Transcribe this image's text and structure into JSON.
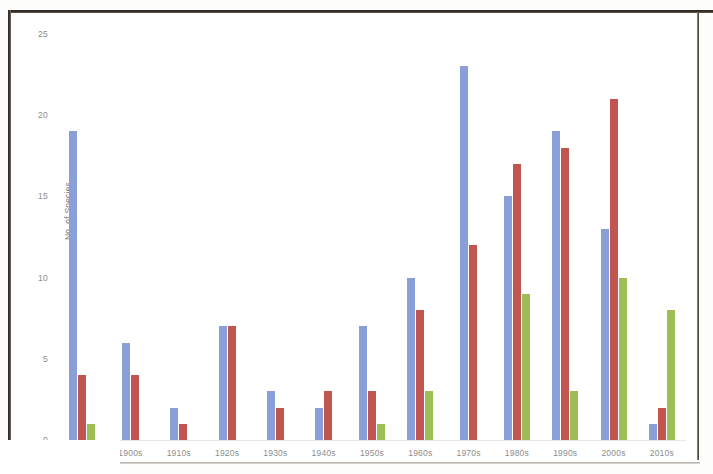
{
  "chart_data": {
    "type": "bar",
    "title": "",
    "xlabel": "",
    "ylabel": "No. of Species",
    "ylim": [
      0,
      25
    ],
    "yticks": [
      0,
      5,
      10,
      15,
      20,
      25
    ],
    "grid": false,
    "legend": "none",
    "categories": [
      "1890s",
      "1900s",
      "1910s",
      "1920s",
      "1930s",
      "1940s",
      "1950s",
      "1960s",
      "1970s",
      "1980s",
      "1990s",
      "2000s",
      "2010s"
    ],
    "series": [
      {
        "name": "Series 1",
        "color": "#8a9ed8",
        "values": [
          19,
          6,
          2,
          7,
          3,
          2,
          7,
          10,
          23,
          15,
          19,
          13,
          1
        ]
      },
      {
        "name": "Series 2",
        "color": "#c0564f",
        "values": [
          4,
          4,
          1,
          7,
          2,
          3,
          3,
          8,
          12,
          17,
          18,
          21,
          2
        ]
      },
      {
        "name": "Series 3",
        "color": "#9dbd56",
        "values": [
          1,
          0,
          0,
          0,
          0,
          0,
          1,
          3,
          0,
          9,
          3,
          10,
          8
        ]
      }
    ]
  },
  "colors": {
    "series_1": "#8a9ed8",
    "series_2": "#c0564f",
    "series_3": "#9dbd56",
    "axis_text": "#8d8d8d",
    "page_background": "#ffffff"
  }
}
